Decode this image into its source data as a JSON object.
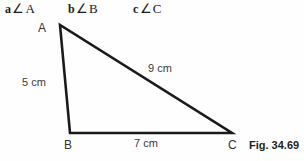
{
  "notation": {
    "items": [
      {
        "side": "a",
        "angle_symbol": "∠",
        "vertex": "A"
      },
      {
        "side": "b",
        "angle_symbol": "∠",
        "vertex": "B"
      },
      {
        "side": "c",
        "angle_symbol": "∠",
        "vertex": "C"
      }
    ]
  },
  "figure": {
    "caption": "Fig. 34.69",
    "stroke_color": "#1a1a1a",
    "background_color": "#fefefe",
    "vertices": [
      {
        "label": "A",
        "x": 60,
        "y": 25
      },
      {
        "label": "B",
        "x": 70,
        "y": 133
      },
      {
        "label": "C",
        "x": 232,
        "y": 133
      }
    ],
    "sides": [
      {
        "label": "5 cm",
        "from": "A",
        "to": "B",
        "value": 5,
        "unit": "cm"
      },
      {
        "label": "9 cm",
        "from": "A",
        "to": "C",
        "value": 9,
        "unit": "cm"
      },
      {
        "label": "7 cm",
        "from": "B",
        "to": "C",
        "value": 7,
        "unit": "cm"
      }
    ]
  },
  "chart_data": {
    "type": "diagram",
    "title": "Fig. 34.69",
    "shape": "triangle",
    "vertex_labels": [
      "A",
      "B",
      "C"
    ],
    "side_lengths": [
      {
        "side": "AB",
        "length": 5,
        "unit": "cm",
        "label": "5 cm"
      },
      {
        "side": "AC",
        "length": 9,
        "unit": "cm",
        "label": "9 cm"
      },
      {
        "side": "BC",
        "length": 7,
        "unit": "cm",
        "label": "7 cm"
      }
    ],
    "notation_legend": [
      "a∠A",
      "b∠B",
      "c∠C"
    ]
  }
}
